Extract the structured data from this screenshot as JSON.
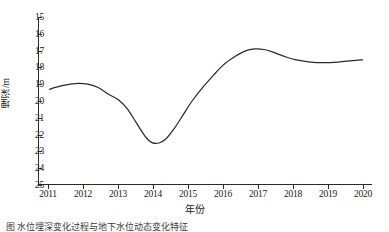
{
  "chart_data": {
    "type": "line",
    "title": "",
    "xlabel": "年份",
    "ylabel": "埋深/m",
    "x": [
      2011,
      2012,
      2013,
      2014,
      2015,
      2016,
      2017,
      2018,
      2019,
      2020
    ],
    "xtick_labels": [
      "2011",
      "2012",
      "2013",
      "2014",
      "2015",
      "2016",
      "2017",
      "2018",
      "2019",
      "2020"
    ],
    "ytick_labels": [
      "15",
      "16",
      "17",
      "18",
      "19",
      "20",
      "21",
      "22",
      "23",
      "24",
      "25"
    ],
    "ytick_values": [
      15,
      16,
      17,
      18,
      19,
      20,
      21,
      22,
      23,
      24,
      25
    ],
    "ylim": [
      15,
      25
    ],
    "y_axis_inverted": true,
    "xlim": [
      2010.7,
      2020.3
    ],
    "grid": false,
    "legend": null,
    "series": [
      {
        "name": "埋深",
        "color": "#2b2b2b",
        "values": [
          19.3,
          18.95,
          19.9,
          22.5,
          20.1,
          17.9,
          16.9,
          17.3,
          17.7,
          17.55
        ]
      }
    ],
    "curve_points": [
      {
        "x": 2011.0,
        "y": 19.3
      },
      {
        "x": 2011.3,
        "y": 19.12
      },
      {
        "x": 2011.6,
        "y": 19.0
      },
      {
        "x": 2011.85,
        "y": 18.95
      },
      {
        "x": 2012.1,
        "y": 19.0
      },
      {
        "x": 2012.4,
        "y": 19.2
      },
      {
        "x": 2012.7,
        "y": 19.6
      },
      {
        "x": 2013.0,
        "y": 19.95
      },
      {
        "x": 2013.25,
        "y": 20.5
      },
      {
        "x": 2013.5,
        "y": 21.3
      },
      {
        "x": 2013.75,
        "y": 22.1
      },
      {
        "x": 2013.95,
        "y": 22.48
      },
      {
        "x": 2014.15,
        "y": 22.5
      },
      {
        "x": 2014.35,
        "y": 22.25
      },
      {
        "x": 2014.6,
        "y": 21.6
      },
      {
        "x": 2014.85,
        "y": 20.8
      },
      {
        "x": 2015.1,
        "y": 20.0
      },
      {
        "x": 2015.4,
        "y": 19.2
      },
      {
        "x": 2015.7,
        "y": 18.5
      },
      {
        "x": 2016.0,
        "y": 17.85
      },
      {
        "x": 2016.3,
        "y": 17.4
      },
      {
        "x": 2016.6,
        "y": 17.05
      },
      {
        "x": 2016.9,
        "y": 16.9
      },
      {
        "x": 2017.2,
        "y": 16.95
      },
      {
        "x": 2017.5,
        "y": 17.15
      },
      {
        "x": 2017.8,
        "y": 17.38
      },
      {
        "x": 2018.1,
        "y": 17.55
      },
      {
        "x": 2018.5,
        "y": 17.68
      },
      {
        "x": 2018.9,
        "y": 17.72
      },
      {
        "x": 2019.3,
        "y": 17.68
      },
      {
        "x": 2019.7,
        "y": 17.6
      },
      {
        "x": 2020.0,
        "y": 17.55
      }
    ],
    "annotations": []
  },
  "axes": {
    "y_title": "埋深/m",
    "x_title": "年份"
  },
  "caption": {
    "text": "图    水位埋深变化过程与地下水位动态变化特征"
  }
}
